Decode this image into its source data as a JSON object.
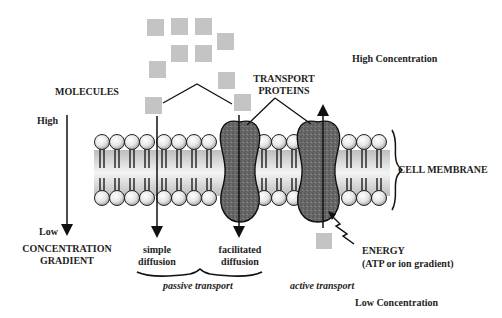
{
  "diagram": {
    "labels": {
      "molecules": "MOLECULES",
      "transport_proteins_1": "TRANSPORT",
      "transport_proteins_2": "PROTEINS",
      "high_concentration": "High Concentration",
      "low_concentration": "Low Concentration",
      "high": "High",
      "low": "Low",
      "gradient_1": "CONCENTRATION",
      "gradient_2": "GRADIENT",
      "cell_membrane": "CELL MEMBRANE",
      "simple_1": "simple",
      "simple_2": "diffusion",
      "facilitated_1": "facilitated",
      "facilitated_2": "diffusion",
      "passive_transport": "passive transport",
      "active_transport": "active transport",
      "energy_1": "ENERGY",
      "energy_2": "(ATP or ion gradient)"
    },
    "colors": {
      "molecule": "#c4c4c4",
      "protein": "#555555",
      "head": "#e8e8e8",
      "membrane_core": "#d9d9d9",
      "line": "#111111"
    }
  }
}
